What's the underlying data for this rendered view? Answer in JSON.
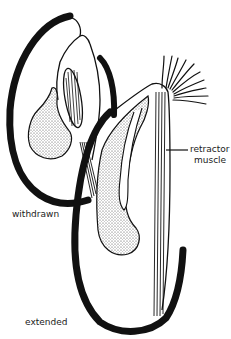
{
  "diagram": {
    "labels": {
      "withdrawn": "withdrawn",
      "extended": "extended",
      "retractor_line1": "retractor",
      "retractor_line2": "muscle"
    },
    "colors": {
      "ink": "#111111",
      "background": "#ffffff",
      "stipple_fill": "#d9d9d9"
    }
  }
}
